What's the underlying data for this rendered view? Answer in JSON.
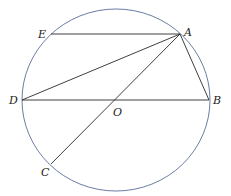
{
  "diagram": {
    "type": "geometry",
    "circle": {
      "center": "O",
      "cx": 116,
      "cy": 100,
      "rx": 94,
      "ry": 91,
      "stroke": "#5a6d9a"
    },
    "line_color": "#2a2a2a",
    "points": {
      "A": {
        "label": "A",
        "x": 180,
        "y": 34
      },
      "B": {
        "label": "B",
        "x": 209,
        "y": 100
      },
      "C": {
        "label": "C",
        "x": 51,
        "y": 164
      },
      "D": {
        "label": "D",
        "x": 22,
        "y": 100
      },
      "E": {
        "label": "E",
        "x": 51,
        "y": 34
      },
      "O": {
        "label": "O",
        "x": 116,
        "y": 100
      }
    },
    "segments": [
      "EA",
      "AD",
      "AC",
      "AB",
      "DB"
    ]
  }
}
